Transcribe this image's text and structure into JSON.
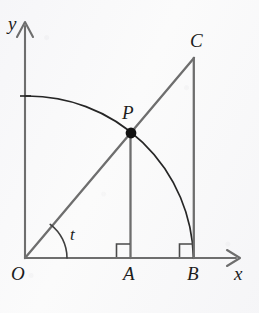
{
  "figure": {
    "background_color": "#fbfbfb",
    "width": 259,
    "height": 313,
    "axis_color": "#6e6e6e",
    "line_color": "#6e6e6e",
    "arc_color": "#262626",
    "point_color": "#111111",
    "label_color": "#1d1d1d"
  },
  "labels": {
    "y_axis": "y",
    "x_axis": "x",
    "origin": "O",
    "point_a": "A",
    "point_b": "B",
    "point_c": "C",
    "point_p": "P",
    "angle_t": "t"
  },
  "geometry": {
    "origin": {
      "x": 25,
      "y": 258
    },
    "x_axis_end": {
      "x": 240,
      "y": 258
    },
    "y_axis_end": {
      "x": 25,
      "y": 22
    },
    "point_a": {
      "x": 130,
      "y": 258
    },
    "point_b": {
      "x": 194,
      "y": 258
    },
    "point_c": {
      "x": 194,
      "y": 58
    },
    "point_p": {
      "x": 131,
      "y": 133
    },
    "arc_start": {
      "x": 25,
      "y": 96
    },
    "arc_end": {
      "x": 194,
      "y": 258
    },
    "arc_radius": 166,
    "angle_arc_radius": 42,
    "right_angle_size": 14
  },
  "elements": {
    "segment_oc": "O to C ray through P",
    "segment_ap": "A to P vertical",
    "segment_bc": "B to C vertical",
    "arc_quarter": "quarter circle radius OB centered at O",
    "right_angle_a": "right angle marker at A",
    "right_angle_b": "right angle marker at B",
    "angle_marker_t": "angle t between x-axis and ray OC"
  }
}
